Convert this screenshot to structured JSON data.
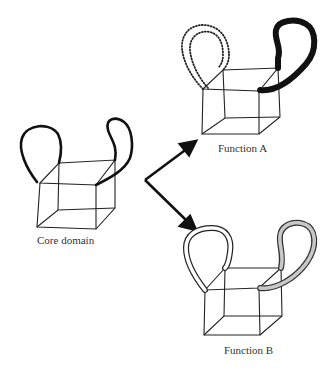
{
  "figure": {
    "labels": {
      "core": "Core domain",
      "function_a": "Function A",
      "function_b": "Function B"
    },
    "colors": {
      "ink": "#1a1a1a",
      "stipple": "#c8c8c8",
      "background": "#ffffff"
    }
  }
}
